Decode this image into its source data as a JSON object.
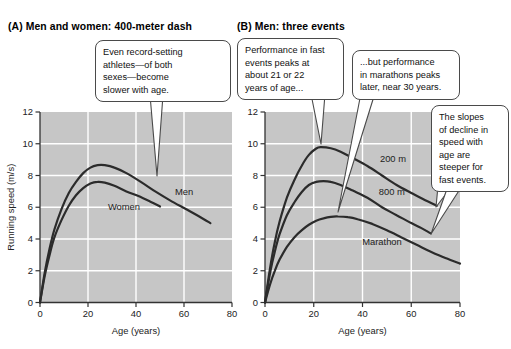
{
  "figure": {
    "panel_a_title": "(A) Men and women: 400-meter dash",
    "panel_b_title": "(B) Men: three events"
  },
  "callouts": {
    "record_setting": "Even record-setting\nathletes—of both\nsexes—become\nslower with age.",
    "fast_events_peak": "Performance in fast\nevents peaks at\nabout 21 or 22\nyears of age...",
    "marathon_peak": "...but performance\nin marathons peaks\nlater, near 30 years.",
    "slopes": "The slopes\nof decline in\nspeed with\nage are\nsteeper for\nfast events."
  },
  "colors": {
    "figure_background": "#ffffff",
    "plot_background": "#c6c6c6",
    "gridline": "#ffffff",
    "curve": "#2b2b2b",
    "axis": "#333333",
    "callout_border": "#4a4a4a",
    "text": "#111111"
  },
  "chart_data": [
    {
      "type": "line",
      "panel": "A",
      "title": "Men and women: 400-meter dash",
      "xlabel": "Age (years)",
      "ylabel": "Running speed (m/s)",
      "xlim": [
        0,
        80
      ],
      "ylim": [
        0,
        12
      ],
      "xticks": [
        0,
        20,
        40,
        60,
        80
      ],
      "yticks": [
        0,
        2,
        4,
        6,
        8,
        10,
        12
      ],
      "grid": true,
      "series": [
        {
          "name": "Men",
          "label_at": [
            60,
            7.0
          ],
          "points": [
            [
              0,
              0
            ],
            [
              2,
              1.9
            ],
            [
              4,
              3.4
            ],
            [
              6,
              4.6
            ],
            [
              9,
              5.9
            ],
            [
              12,
              6.9
            ],
            [
              15,
              7.6
            ],
            [
              18,
              8.15
            ],
            [
              21,
              8.5
            ],
            [
              24,
              8.65
            ],
            [
              27,
              8.65
            ],
            [
              31,
              8.5
            ],
            [
              36,
              8.15
            ],
            [
              42,
              7.6
            ],
            [
              48,
              7.0
            ],
            [
              54,
              6.45
            ],
            [
              60,
              5.95
            ],
            [
              66,
              5.45
            ],
            [
              71,
              5.0
            ]
          ]
        },
        {
          "name": "Women",
          "label_at": [
            35,
            6.0
          ],
          "points": [
            [
              0,
              0
            ],
            [
              2,
              1.7
            ],
            [
              4,
              3.0
            ],
            [
              6,
              4.1
            ],
            [
              9,
              5.2
            ],
            [
              12,
              6.1
            ],
            [
              15,
              6.75
            ],
            [
              18,
              7.2
            ],
            [
              21,
              7.5
            ],
            [
              24,
              7.6
            ],
            [
              27,
              7.55
            ],
            [
              31,
              7.35
            ],
            [
              36,
              7.0
            ],
            [
              41,
              6.7
            ],
            [
              46,
              6.35
            ],
            [
              50,
              6.05
            ]
          ]
        }
      ]
    },
    {
      "type": "line",
      "panel": "B",
      "title": "Men: three events",
      "xlabel": "Age (years)",
      "ylabel": "",
      "xlim": [
        0,
        80
      ],
      "ylim": [
        0,
        12
      ],
      "xticks": [
        0,
        20,
        40,
        60,
        80
      ],
      "yticks": [
        0,
        2,
        4,
        6,
        8,
        10,
        12
      ],
      "grid": true,
      "series": [
        {
          "name": "200 m",
          "label_at": [
            52.5,
            9.05
          ],
          "points": [
            [
              0,
              0
            ],
            [
              2,
              2.1
            ],
            [
              4,
              3.8
            ],
            [
              6,
              5.1
            ],
            [
              9,
              6.6
            ],
            [
              12,
              7.7
            ],
            [
              15,
              8.6
            ],
            [
              18,
              9.3
            ],
            [
              21,
              9.7
            ],
            [
              23,
              9.78
            ],
            [
              27,
              9.72
            ],
            [
              31,
              9.5
            ],
            [
              36,
              9.1
            ],
            [
              42,
              8.6
            ],
            [
              48,
              8.0
            ],
            [
              54,
              7.4
            ],
            [
              60,
              6.9
            ],
            [
              65,
              6.5
            ],
            [
              70.5,
              6.1
            ]
          ]
        },
        {
          "name": "800 m",
          "label_at": [
            52,
            6.95
          ],
          "points": [
            [
              0,
              0
            ],
            [
              2,
              1.8
            ],
            [
              4,
              3.2
            ],
            [
              6,
              4.3
            ],
            [
              9,
              5.5
            ],
            [
              12,
              6.3
            ],
            [
              15,
              6.95
            ],
            [
              18,
              7.4
            ],
            [
              21,
              7.6
            ],
            [
              24,
              7.65
            ],
            [
              27,
              7.6
            ],
            [
              31,
              7.4
            ],
            [
              36,
              7.05
            ],
            [
              42,
              6.6
            ],
            [
              48,
              6.0
            ],
            [
              54,
              5.5
            ],
            [
              60,
              5.0
            ],
            [
              64,
              4.7
            ],
            [
              68,
              4.35
            ]
          ]
        },
        {
          "name": "Marathon",
          "label_at": [
            48,
            3.85
          ],
          "points": [
            [
              0,
              0
            ],
            [
              2,
              1.1
            ],
            [
              4,
              2.0
            ],
            [
              6,
              2.7
            ],
            [
              9,
              3.5
            ],
            [
              12,
              4.1
            ],
            [
              15,
              4.55
            ],
            [
              18,
              4.9
            ],
            [
              21,
              5.15
            ],
            [
              24,
              5.3
            ],
            [
              27,
              5.4
            ],
            [
              30,
              5.42
            ],
            [
              34,
              5.38
            ],
            [
              38,
              5.25
            ],
            [
              44,
              4.95
            ],
            [
              50,
              4.55
            ],
            [
              56,
              4.1
            ],
            [
              62,
              3.65
            ],
            [
              68,
              3.2
            ],
            [
              74,
              2.8
            ],
            [
              80,
              2.45
            ]
          ]
        }
      ]
    }
  ]
}
